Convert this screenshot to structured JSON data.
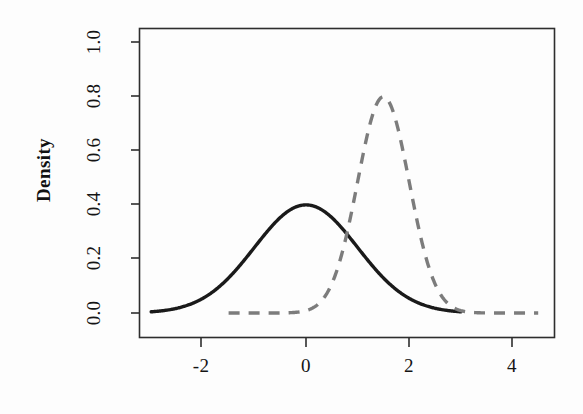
{
  "figure": {
    "background_color": "#fdfdfd",
    "frame_color": "#2e2e2e",
    "ylabel": "Density",
    "xlabel": ""
  },
  "chart_data": {
    "type": "line",
    "title": "",
    "xlabel": "",
    "ylabel": "Density",
    "xlim": [
      -3.2,
      5.2
    ],
    "ylim": [
      -0.03,
      1.05
    ],
    "grid": false,
    "legend": "none",
    "x_tick_labels": [
      "-2",
      "0",
      "2",
      "4"
    ],
    "x_tick_values": [
      -2,
      0,
      2,
      4
    ],
    "y_tick_labels": [
      "0.0",
      "0.2",
      "0.4",
      "0.6",
      "0.8",
      "1.0"
    ],
    "y_tick_values": [
      0.0,
      0.2,
      0.4,
      0.6,
      0.8,
      1.0
    ],
    "series": [
      {
        "name": "prior",
        "style": "solid",
        "color": "#1a1a1a",
        "linewidth": 3.4,
        "distribution": "normal",
        "mean": 0.0,
        "sd": 1.0,
        "peak_x": 0.0,
        "peak_y": 0.4,
        "x_range": [
          -3.0,
          3.0
        ],
        "x": [
          -3.0,
          -2.75,
          -2.5,
          -2.25,
          -2.0,
          -1.75,
          -1.5,
          -1.25,
          -1.0,
          -0.75,
          -0.5,
          -0.25,
          0.0,
          0.25,
          0.5,
          0.75,
          1.0,
          1.25,
          1.5,
          1.75,
          2.0,
          2.25,
          2.5,
          2.75,
          3.0
        ],
        "values": [
          0.0044,
          0.0091,
          0.0175,
          0.0317,
          0.054,
          0.0863,
          0.1295,
          0.1826,
          0.242,
          0.3011,
          0.3521,
          0.3867,
          0.3989,
          0.3867,
          0.3521,
          0.3011,
          0.242,
          0.1826,
          0.1295,
          0.0863,
          0.054,
          0.0317,
          0.0175,
          0.0091,
          0.0044
        ]
      },
      {
        "name": "posterior",
        "style": "dashed",
        "color": "#7c7c7c",
        "linewidth": 3.4,
        "dash_pattern": "11 9",
        "distribution": "normal",
        "mean": 1.5,
        "sd": 0.5,
        "peak_x": 1.5,
        "peak_y": 0.798,
        "x_range": [
          -1.5,
          4.5
        ],
        "x": [
          -1.5,
          -1.25,
          -1.0,
          -0.75,
          -0.5,
          -0.25,
          0.0,
          0.25,
          0.5,
          0.75,
          1.0,
          1.25,
          1.5,
          1.75,
          2.0,
          2.25,
          2.5,
          2.75,
          3.0,
          3.25,
          3.5,
          3.75,
          4.0,
          4.25,
          4.5
        ],
        "values": [
          0.0,
          0.0,
          0.0,
          0.0001,
          0.0003,
          0.0013,
          0.0044,
          0.0175,
          0.054,
          0.1295,
          0.242,
          0.3521,
          0.7979,
          0.3521,
          0.242,
          0.1295,
          0.054,
          0.0175,
          0.0044,
          0.0013,
          0.0003,
          0.0001,
          0.0,
          0.0,
          0.0
        ]
      }
    ]
  }
}
